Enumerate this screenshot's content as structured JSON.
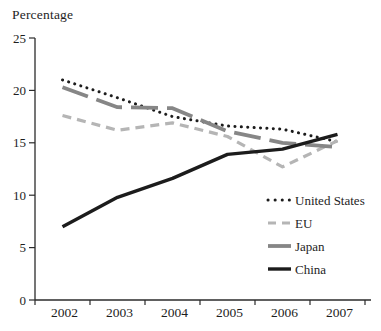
{
  "chart_data": {
    "type": "line",
    "title": "Percentage",
    "categories": [
      "2002",
      "2003",
      "2004",
      "2005",
      "2006",
      "2007"
    ],
    "xlabel": "",
    "ylabel": "Percentage",
    "ylim": [
      0,
      25
    ],
    "yticks": [
      0,
      5,
      10,
      15,
      20,
      25
    ],
    "grid": false,
    "legend_position": "inside-bottom-right",
    "axis_color": "#2b2b2b",
    "series": [
      {
        "name": "United States",
        "values": [
          21.0,
          19.3,
          17.5,
          16.6,
          16.3,
          15.1
        ],
        "color": "#1c1c1c",
        "line_style": "dotted"
      },
      {
        "name": "EU",
        "values": [
          17.6,
          16.2,
          16.9,
          15.6,
          12.7,
          15.2
        ],
        "color": "#b5b5b5",
        "line_style": "dashed"
      },
      {
        "name": "Japan",
        "values": [
          20.3,
          18.4,
          18.3,
          16.1,
          15.0,
          14.6
        ],
        "color": "#868686",
        "line_style": "long-dash"
      },
      {
        "name": "China",
        "values": [
          7.0,
          9.8,
          11.6,
          13.9,
          14.4,
          15.8
        ],
        "color": "#1c1c1c",
        "line_style": "solid"
      }
    ]
  }
}
